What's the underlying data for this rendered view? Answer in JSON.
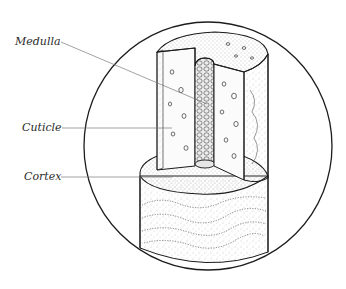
{
  "diagram": {
    "labels": [
      {
        "id": "medulla",
        "text": "Medulla",
        "x": 15,
        "y": 45,
        "leader": {
          "x1": 61,
          "y1": 42,
          "x2": 207,
          "y2": 104
        }
      },
      {
        "id": "cuticle",
        "text": "Cuticle",
        "x": 22,
        "y": 131,
        "leader": {
          "x1": 62,
          "y1": 128,
          "x2": 172,
          "y2": 128
        }
      },
      {
        "id": "cortex",
        "text": "Cortex",
        "x": 24,
        "y": 180,
        "leader": {
          "x1": 61,
          "y1": 177,
          "x2": 172,
          "y2": 177
        }
      }
    ],
    "frame": {
      "shape": "circle",
      "cx": 208,
      "cy": 146,
      "r": 124
    },
    "colors": {
      "line": "#1c1c1c",
      "leader": "#7a7a7a",
      "stipple": "#8a8a8a",
      "background": "#ffffff"
    }
  }
}
